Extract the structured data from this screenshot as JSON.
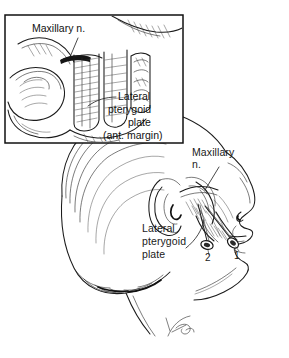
{
  "figure": {
    "background_color": "#ffffff",
    "ink_color": "#1b1b1b",
    "width": 289,
    "height": 358
  },
  "inset": {
    "name": "inset-panel",
    "border_color": "#111111",
    "x": 5,
    "y": 15,
    "width": 178,
    "height": 128,
    "labels": {
      "maxillary_nerve": "Maxillary n.",
      "lateral": "Lateral",
      "pterygoid": "pterygoid",
      "plate": "plate",
      "ant_margin": "(ant. margin)"
    }
  },
  "main": {
    "name": "head-profile-panel",
    "labels": {
      "maxillary_line1": "Maxillary",
      "maxillary_line2": "n.",
      "lateral": "Lateral",
      "pterygoid": "pterygoid",
      "plate": "plate"
    },
    "needles": [
      {
        "id": "needle-1",
        "number": "1",
        "label_x": 234,
        "label_y": 257
      },
      {
        "id": "needle-2",
        "number": "2",
        "label_x": 205,
        "label_y": 259
      }
    ]
  },
  "signature": {
    "name": "artist-signature",
    "visible": true
  }
}
